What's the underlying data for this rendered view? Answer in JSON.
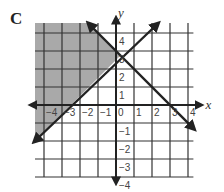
{
  "figure_label": "C",
  "chart_data": {
    "type": "line",
    "title": "C",
    "xlabel": "x",
    "ylabel": "y",
    "xlim": [
      -4.5,
      4.5
    ],
    "ylim": [
      -4,
      4.5
    ],
    "grid": true,
    "x_ticks": [
      "-4",
      "-3",
      "-2",
      "-1",
      "0",
      "1",
      "2",
      "3",
      "4"
    ],
    "y_ticks": [
      "4",
      "3",
      "2",
      "1",
      "-1",
      "-2",
      "-3",
      "-4"
    ],
    "series": [
      {
        "name": "line 1 (rising)",
        "equation": "y = x + 2.5",
        "points": [
          [
            -4.5,
            -2
          ],
          [
            2.3,
            4.5
          ]
        ]
      },
      {
        "name": "line 2 (falling)",
        "equation": "y = -x + 3",
        "points": [
          [
            -1.5,
            4.5
          ],
          [
            4.3,
            -1.3
          ]
        ]
      }
    ],
    "shaded_region": "above rising line and below/left of falling line (upper-left)",
    "shade_color": "#a9a9a9"
  }
}
